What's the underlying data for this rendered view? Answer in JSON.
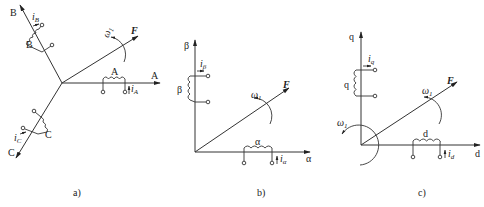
{
  "figure": {
    "panels": [
      {
        "id": "a",
        "caption": "a)",
        "axes": [
          {
            "name": "A",
            "label": "A"
          },
          {
            "name": "B",
            "label": "B"
          },
          {
            "name": "C",
            "label": "C"
          }
        ],
        "coils": [
          {
            "label": "A",
            "current_symbol": "i",
            "current_sub": "A"
          },
          {
            "label": "B",
            "current_symbol": "i",
            "current_sub": "B"
          },
          {
            "label": "C",
            "current_symbol": "i",
            "current_sub": "C"
          }
        ],
        "vector_label": "F",
        "rotation_symbol": "ω",
        "rotation_sub": "1"
      },
      {
        "id": "b",
        "caption": "b)",
        "axes": [
          {
            "name": "alpha",
            "label": "α"
          },
          {
            "name": "beta",
            "label": "β"
          }
        ],
        "coils": [
          {
            "label": "α",
            "current_symbol": "i",
            "current_sub": "α"
          },
          {
            "label": "β",
            "current_symbol": "i",
            "current_sub": "β"
          }
        ],
        "vector_label": "F",
        "rotation_symbol": "ω",
        "rotation_sub": "1"
      },
      {
        "id": "c",
        "caption": "c)",
        "axes": [
          {
            "name": "d",
            "label": "d"
          },
          {
            "name": "q",
            "label": "q"
          }
        ],
        "coils": [
          {
            "label": "d",
            "current_symbol": "i",
            "current_sub": "d"
          },
          {
            "label": "q",
            "current_symbol": "i",
            "current_sub": "q"
          }
        ],
        "vector_label": "F",
        "rotation_symbol": "ω",
        "rotation_sub": "1",
        "frame_rotation_symbol": "ω",
        "frame_rotation_sub": "1"
      }
    ]
  }
}
